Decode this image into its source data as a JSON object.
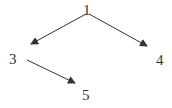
{
  "diagram": {
    "type": "tree",
    "nodes": [
      {
        "id": "n1",
        "label": "1"
      },
      {
        "id": "n3",
        "label": "3"
      },
      {
        "id": "n4",
        "label": "4"
      },
      {
        "id": "n5",
        "label": "5"
      }
    ],
    "edges": [
      {
        "from": "1",
        "to": "3"
      },
      {
        "from": "1",
        "to": "4"
      },
      {
        "from": "3",
        "to": "5"
      }
    ],
    "colors": {
      "line": "#333333",
      "text": "#333333"
    }
  }
}
